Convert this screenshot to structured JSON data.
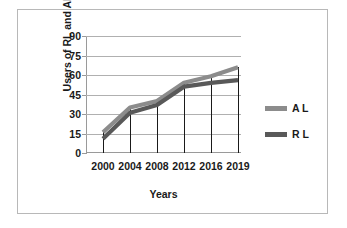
{
  "chart_data": {
    "type": "line",
    "title": "",
    "xlabel": "Years",
    "ylabel": "Users of RL and AL",
    "categories": [
      "2000",
      "2004",
      "2008",
      "2012",
      "2016",
      "2019"
    ],
    "x": [
      2000,
      2004,
      2008,
      2012,
      2016,
      2019
    ],
    "ylim": [
      0,
      90
    ],
    "yticks": [
      0,
      15,
      30,
      45,
      60,
      75,
      90
    ],
    "grid": true,
    "legend_position": "right",
    "series": [
      {
        "name": "A L",
        "color": "#8c8c8c",
        "values": [
          16,
          35,
          40,
          54,
          59,
          66
        ]
      },
      {
        "name": "R L",
        "color": "#595959",
        "values": [
          11,
          31,
          37,
          51,
          54,
          56
        ]
      }
    ]
  },
  "axes": {
    "y_title": "Users of RL and AL",
    "x_title": "Years",
    "y_tick_labels": [
      "90",
      "75",
      "60",
      "45",
      "30",
      "15",
      "0"
    ],
    "x_tick_labels": [
      "2000",
      "2004",
      "2008",
      "2012",
      "2016",
      "2019"
    ]
  },
  "legend": {
    "items": [
      {
        "label": "A L",
        "color": "#8c8c8c"
      },
      {
        "label": "R L",
        "color": "#595959"
      }
    ]
  },
  "colors": {
    "al_series": "#8c8c8c",
    "rl_series": "#595959",
    "gridline": "#b0b0b0",
    "axis": "#9a9a9a",
    "frame": "#b8b8b8",
    "text": "#1a1a1a",
    "background": "#ffffff"
  }
}
